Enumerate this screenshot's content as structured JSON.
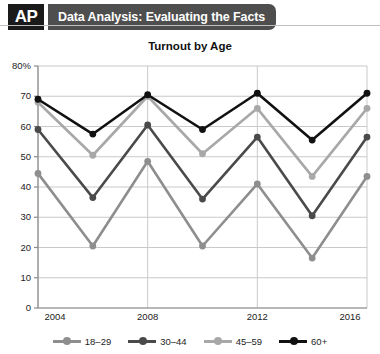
{
  "header": {
    "logo_text": "AP",
    "title": "Data Analysis: Evaluating the Facts"
  },
  "chart_data": {
    "type": "line",
    "title": "Turnout by Age",
    "xlabel": "",
    "ylabel": "",
    "grid": true,
    "legend_position": "bottom",
    "xlim": [
      2004,
      2016
    ],
    "ylim": [
      0,
      80
    ],
    "x": [
      2004,
      2006,
      2008,
      2010,
      2012,
      2014,
      2016
    ],
    "xtick_labels": [
      "2004",
      "2008",
      "2012",
      "2016"
    ],
    "xtick_values": [
      2004,
      2008,
      2012,
      2016
    ],
    "ytick_labels": [
      "0",
      "10",
      "20",
      "30",
      "40",
      "50",
      "60",
      "70",
      "80%"
    ],
    "ytick_values": [
      0,
      10,
      20,
      30,
      40,
      50,
      60,
      70,
      80
    ],
    "series": [
      {
        "name": "18–29",
        "color": "#8e8e8e",
        "values": [
          44.5,
          20.5,
          48.5,
          20.5,
          41.0,
          16.5,
          43.5
        ]
      },
      {
        "name": "30–44",
        "color": "#4a4a4a",
        "values": [
          59.0,
          36.5,
          60.5,
          36.0,
          56.5,
          30.5,
          56.5
        ]
      },
      {
        "name": "45–59",
        "color": "#a8a8a8",
        "values": [
          68.0,
          50.5,
          70.0,
          51.0,
          66.0,
          43.5,
          66.0
        ]
      },
      {
        "name": "60+",
        "color": "#111111",
        "values": [
          69.0,
          57.5,
          70.5,
          59.0,
          71.0,
          55.5,
          71.0
        ]
      }
    ]
  },
  "colors": {
    "header_bar": "#4e4e4e",
    "logo_bg": "#1a1a1a",
    "grid": "#c9c9c9",
    "axis": "#8a8a8a"
  }
}
